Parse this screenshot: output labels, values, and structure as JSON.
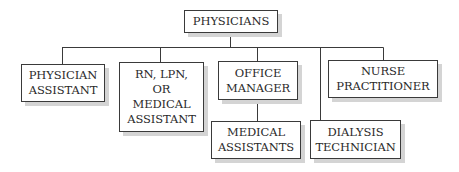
{
  "diagram": {
    "type": "org-chart",
    "colors": {
      "line": "#3a3a3a",
      "box_border": "#3a3a3a",
      "shadow": "#d4d4d4",
      "text": "#2a2a2a"
    },
    "root": {
      "id": "physicians",
      "lines": [
        "PHYSICIANS"
      ]
    },
    "nodes": [
      {
        "id": "physician-assistant",
        "parent": "physicians",
        "lines": [
          "PHYSICIAN",
          "ASSISTANT"
        ]
      },
      {
        "id": "rn-lpn-medical-assistant",
        "parent": "physicians",
        "lines": [
          "RN, LPN,",
          "OR",
          "MEDICAL",
          "ASSISTANT"
        ]
      },
      {
        "id": "office-manager",
        "parent": "physicians",
        "lines": [
          "OFFICE",
          "MANAGER"
        ]
      },
      {
        "id": "medical-assistants",
        "parent": "office-manager",
        "lines": [
          "MEDICAL",
          "ASSISTANTS"
        ]
      },
      {
        "id": "dialysis-technician",
        "parent": "physicians",
        "lines": [
          "DIALYSIS",
          "TECHNICIAN"
        ]
      },
      {
        "id": "nurse-practitioner",
        "parent": "physicians",
        "lines": [
          "NURSE",
          "PRACTITIONER"
        ]
      }
    ]
  }
}
